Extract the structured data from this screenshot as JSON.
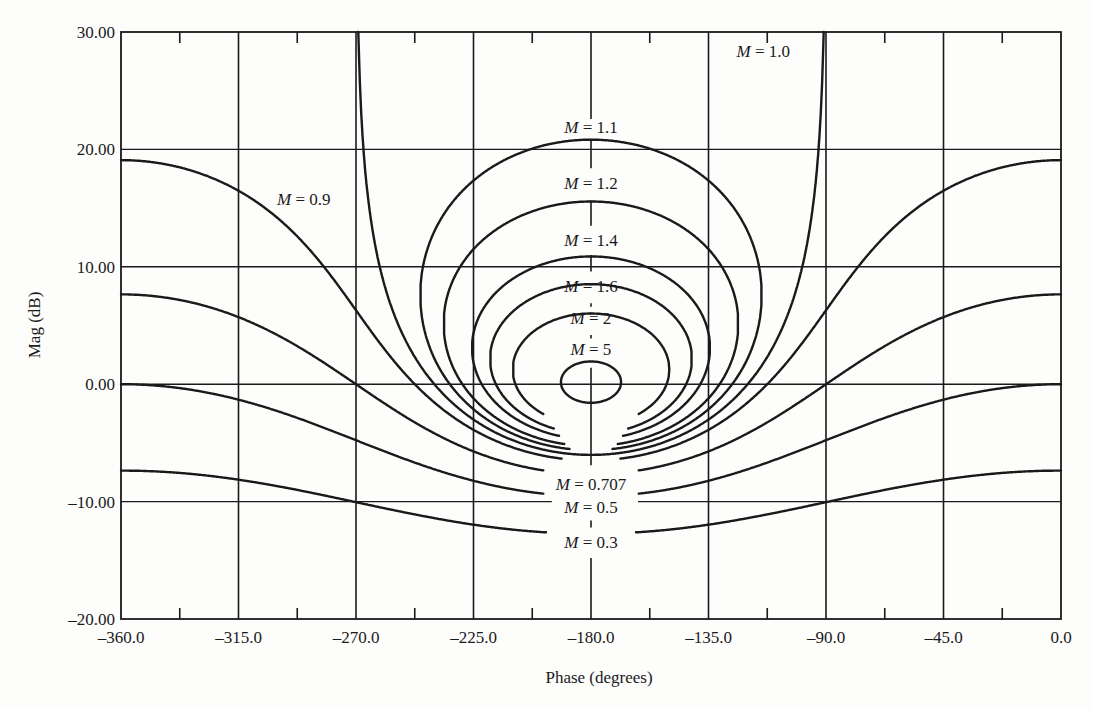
{
  "chart_data": {
    "type": "line",
    "subtype": "nichols-chart",
    "title": "",
    "xlabel": "Phase (degrees)",
    "ylabel": "Mag (dB)",
    "xlim": [
      -360,
      0
    ],
    "ylim": [
      -20,
      30
    ],
    "grid": true,
    "x_ticks": [
      -360,
      -315,
      -270,
      -225,
      -180,
      -135,
      -90,
      -45,
      0
    ],
    "x_tick_labels": [
      "-360.0",
      "-315.0",
      "-270.0",
      "-225.0",
      "-180.0",
      "-135.0",
      "-90.0",
      "-45.0",
      "0.0"
    ],
    "x_minor_ticks": [
      -337.5,
      -292.5,
      -247.5,
      -202.5,
      -157.5,
      -112.5,
      -67.5,
      -22.5
    ],
    "y_ticks": [
      -20,
      -10,
      0,
      10,
      20,
      30
    ],
    "y_tick_labels": [
      "-20.00",
      "-10.00",
      "0.00",
      "10.00",
      "20.00",
      "30.00"
    ],
    "series": [
      {
        "name": "M = 5",
        "M": 5,
        "closed": true,
        "lower_gap_deg": 0,
        "label_pos": [
          -180,
          3.0
        ]
      },
      {
        "name": "M = 2",
        "M": 2,
        "closed": true,
        "lower_gap_deg": 18,
        "label_pos": [
          -180,
          5.6
        ]
      },
      {
        "name": "M = 1.6",
        "M": 1.6,
        "closed": true,
        "lower_gap_deg": 14,
        "label_pos": [
          -180,
          8.4
        ]
      },
      {
        "name": "M = 1.4",
        "M": 1.4,
        "closed": true,
        "lower_gap_deg": 12,
        "label_pos": [
          -180,
          12.3
        ]
      },
      {
        "name": "M = 1.2",
        "M": 1.2,
        "closed": true,
        "lower_gap_deg": 10,
        "label_pos": [
          -180,
          17.1
        ]
      },
      {
        "name": "M = 1.1",
        "M": 1.1,
        "closed": true,
        "lower_gap_deg": 8,
        "label_pos": [
          -180,
          21.9
        ]
      },
      {
        "name": "M = 1.0",
        "M": 1.0,
        "closed": false,
        "lower_gap_deg": 0,
        "label_pos": [
          -114,
          28.4
        ]
      },
      {
        "name": "M = 0.9",
        "M": 0.9,
        "closed": false,
        "lower_gap_deg": 11,
        "label_pos": [
          -290,
          15.8
        ]
      },
      {
        "name": "M = 0.707",
        "M": 0.707,
        "closed": false,
        "lower_gap_deg": 18,
        "label_pos": [
          -180,
          -8.5
        ]
      },
      {
        "name": "M = 0.5",
        "M": 0.5,
        "closed": false,
        "lower_gap_deg": 18,
        "label_pos": [
          -180,
          -10.5
        ]
      },
      {
        "name": "M = 0.3",
        "M": 0.3,
        "closed": false,
        "lower_gap_deg": 17,
        "label_pos": [
          -180,
          -13.4
        ]
      }
    ],
    "annotations": [
      "M = 1.0",
      "M = 1.1",
      "M = 1.2",
      "M = 1.4",
      "M = 1.6",
      "M = 2",
      "M = 5",
      "M = 0.9",
      "M = 0.707",
      "M = 0.5",
      "M = 0.3"
    ]
  },
  "style": {
    "line_color": "#1a1a1a",
    "grid_color": "#1a1a1a",
    "background": "#fdfdfc"
  }
}
